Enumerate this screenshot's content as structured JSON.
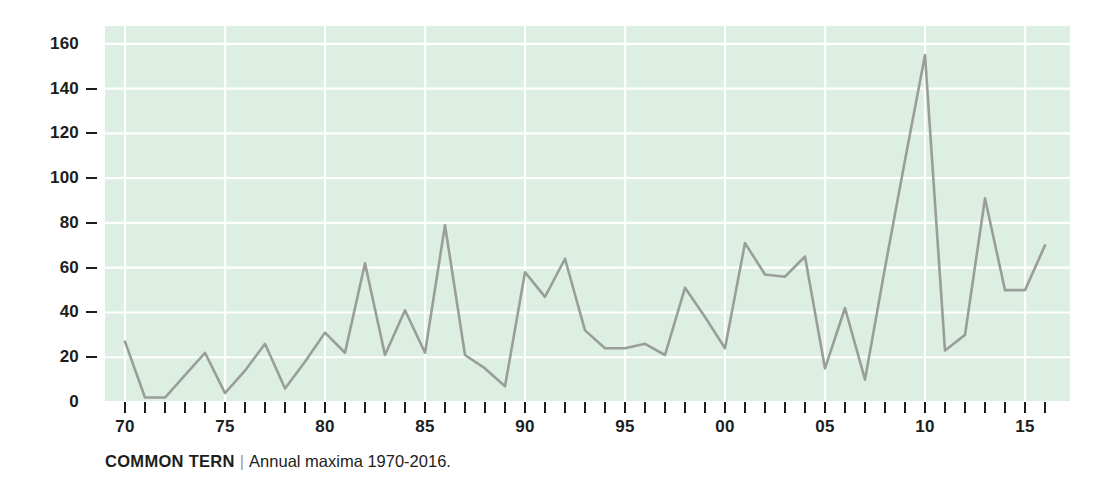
{
  "caption": {
    "species": "COMMON TERN",
    "separator": "|",
    "description": "Annual maxima 1970-2016."
  },
  "colors": {
    "plot_background": "#dcefe2",
    "gridline": "#ffffff",
    "series_line": "#9a9e99",
    "text": "#1d1d1b",
    "page_background": "#ffffff"
  },
  "chart_data": {
    "type": "line",
    "title": "COMMON TERN",
    "subtitle": "Annual maxima 1970-2016.",
    "xlabel": "",
    "ylabel": "",
    "xlim": [
      1969.2,
      1969.2
    ],
    "ylim": [
      0,
      168
    ],
    "grid": true,
    "legend": null,
    "y_ticks": [
      0,
      20,
      40,
      60,
      80,
      100,
      120,
      140,
      160
    ],
    "y_tick_labels": [
      "0",
      "20",
      "40",
      "60",
      "80",
      "100",
      "120",
      "140",
      "160"
    ],
    "x_tick_years": [
      1970,
      1971,
      1972,
      1973,
      1974,
      1975,
      1976,
      1977,
      1978,
      1979,
      1980,
      1981,
      1982,
      1983,
      1984,
      1985,
      1986,
      1987,
      1988,
      1989,
      1990,
      1991,
      1992,
      1993,
      1994,
      1995,
      1996,
      1997,
      1998,
      1999,
      2000,
      2001,
      2002,
      2003,
      2004,
      2005,
      2006,
      2007,
      2008,
      2009,
      2010,
      2011,
      2012,
      2013,
      2014,
      2015,
      2016
    ],
    "x_labeled_years": [
      1970,
      1975,
      1980,
      1985,
      1990,
      1995,
      2000,
      2005,
      2010,
      2015
    ],
    "x_labels": [
      "70",
      "75",
      "80",
      "85",
      "90",
      "95",
      "00",
      "05",
      "10",
      "15"
    ],
    "x": [
      1970,
      1971,
      1972,
      1973,
      1974,
      1975,
      1976,
      1977,
      1978,
      1979,
      1980,
      1981,
      1982,
      1983,
      1984,
      1985,
      1986,
      1987,
      1988,
      1989,
      1990,
      1991,
      1992,
      1993,
      1994,
      1995,
      1996,
      1997,
      1998,
      1999,
      2000,
      2001,
      2002,
      2003,
      2004,
      2005,
      2006,
      2007,
      2008,
      2009,
      2010,
      2011,
      2012,
      2013,
      2014,
      2015,
      2016
    ],
    "values": [
      27,
      2,
      2,
      12,
      22,
      4,
      14,
      26,
      6,
      18,
      31,
      22,
      62,
      21,
      41,
      22,
      79,
      21,
      15,
      7,
      58,
      47,
      64,
      32,
      24,
      24,
      26,
      21,
      51,
      38,
      24,
      71,
      57,
      56,
      65,
      15,
      42,
      10,
      60,
      108,
      155,
      23,
      30,
      91,
      50,
      50,
      70
    ],
    "series": [
      {
        "name": "Annual maxima",
        "values": [
          27,
          2,
          2,
          12,
          22,
          4,
          14,
          26,
          6,
          18,
          31,
          22,
          62,
          21,
          41,
          22,
          79,
          21,
          15,
          7,
          58,
          47,
          64,
          32,
          24,
          24,
          26,
          21,
          51,
          38,
          24,
          71,
          57,
          56,
          65,
          15,
          42,
          10,
          60,
          108,
          155,
          23,
          30,
          91,
          50,
          50,
          70
        ]
      }
    ]
  }
}
